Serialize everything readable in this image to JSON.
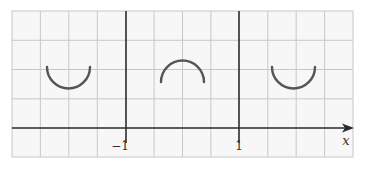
{
  "figure": {
    "type": "function-graph",
    "axis_label_x": "x",
    "tick_labels": [
      "-1",
      "1"
    ],
    "tick_display": {
      "neg_one": "−1",
      "one": "1"
    },
    "curves": [
      {
        "shape": "upward semicircle (cup)",
        "region": "x < -1"
      },
      {
        "shape": "downward semicircle (cap)",
        "region": "-1 < x < 1"
      },
      {
        "shape": "upward semicircle (cup)",
        "region": "x > 1"
      }
    ],
    "colors": {
      "grid": "#c8c8c8",
      "axis": "#2a2a2a",
      "curve": "#555555"
    }
  }
}
